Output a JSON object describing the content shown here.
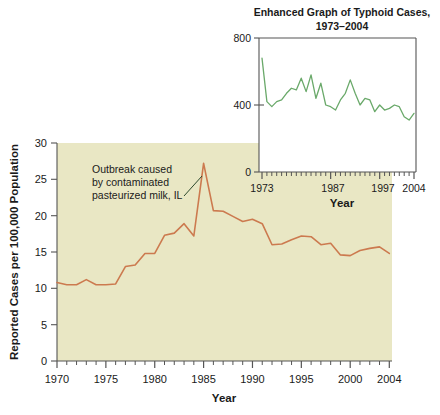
{
  "chart_data": [
    {
      "id": "main",
      "type": "line",
      "title": "",
      "xlabel": "Year",
      "ylabel": "Reported Cases per 100,000 Population",
      "xlim": [
        1970,
        2004
      ],
      "ylim": [
        0,
        30
      ],
      "xticks_labeled": [
        "1970",
        "1975",
        "1980",
        "1985",
        "1990",
        "1995",
        "2000",
        "2004"
      ],
      "xticks_labeled_values": [
        1970,
        1975,
        1980,
        1985,
        1990,
        1995,
        2000,
        2004
      ],
      "yticks": [
        "0",
        "5",
        "10",
        "15",
        "20",
        "25",
        "30"
      ],
      "ytick_values": [
        0,
        5,
        10,
        15,
        20,
        25,
        30
      ],
      "minor_xticks": "every year 1970-2004",
      "grid": false,
      "legend": "none",
      "line_color": "#cc7a4f",
      "plot_background": "#e9e7c4",
      "x": [
        1970,
        1971,
        1972,
        1973,
        1974,
        1975,
        1976,
        1977,
        1978,
        1979,
        1980,
        1981,
        1982,
        1983,
        1984,
        1985,
        1986,
        1987,
        1988,
        1989,
        1990,
        1991,
        1992,
        1993,
        1994,
        1995,
        1996,
        1997,
        1998,
        1999,
        2000,
        2001,
        2002,
        2003,
        2004
      ],
      "values": [
        10.8,
        10.5,
        10.5,
        11.2,
        10.5,
        10.5,
        10.6,
        13.0,
        13.2,
        14.8,
        14.8,
        17.3,
        17.6,
        18.9,
        17.2,
        27.2,
        20.7,
        20.6,
        19.9,
        19.2,
        19.5,
        18.9,
        16.0,
        16.1,
        16.7,
        17.2,
        17.1,
        16.0,
        16.2,
        14.6,
        14.5,
        15.2,
        15.5,
        15.7,
        14.8
      ],
      "annotations": [
        {
          "text": "Outbreak caused by contaminated pasteurized milk, IL",
          "lines": [
            "Outbreak caused",
            "by contaminated",
            "pasteurized milk, IL"
          ],
          "points_to_year": 1985,
          "points_to_value": 27.2
        }
      ]
    },
    {
      "id": "inset",
      "type": "line",
      "title": "Enhanced Graph of Typhoid Cases, 1973–2004",
      "title_lines": [
        "Enhanced Graph of Typhoid Cases,",
        "1973–2004"
      ],
      "xlabel": "Year",
      "ylabel": "",
      "xlim": [
        1973,
        2004
      ],
      "ylim": [
        0,
        800
      ],
      "xticks_labeled": [
        "1973",
        "1987",
        "1997",
        "2004"
      ],
      "xticks_labeled_values": [
        1973,
        1987,
        1997,
        2004
      ],
      "yticks": [
        "0",
        "400",
        "800"
      ],
      "ytick_values": [
        0,
        400,
        800
      ],
      "minor_xticks": "every year 1973-2004",
      "grid": false,
      "legend": "none",
      "line_color": "#6aa96a",
      "plot_background": "#ffffff",
      "x": [
        1973,
        1974,
        1975,
        1976,
        1977,
        1978,
        1979,
        1980,
        1981,
        1982,
        1983,
        1984,
        1985,
        1986,
        1987,
        1988,
        1989,
        1990,
        1991,
        1992,
        1993,
        1994,
        1995,
        1996,
        1997,
        1998,
        1999,
        2000,
        2001,
        2002,
        2003,
        2004
      ],
      "values": [
        680,
        420,
        390,
        420,
        430,
        470,
        500,
        490,
        560,
        480,
        580,
        440,
        530,
        400,
        390,
        370,
        430,
        470,
        550,
        470,
        400,
        440,
        430,
        360,
        400,
        370,
        380,
        400,
        390,
        330,
        310,
        350
      ]
    }
  ]
}
